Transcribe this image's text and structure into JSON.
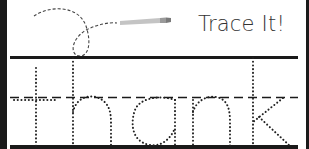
{
  "worksheet": {
    "title": "Trace It!",
    "trace_word": "thank",
    "colors": {
      "ink": "#1a1a1a",
      "dots": "#222222",
      "pencil": "#b8b8b8",
      "background": "#ffffff"
    },
    "icons": {
      "pencil": "pencil-icon",
      "path": "dashed-swirl-path"
    }
  }
}
